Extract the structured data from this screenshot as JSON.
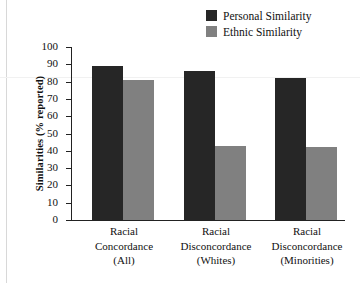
{
  "chart_data": {
    "type": "bar",
    "title": "",
    "xlabel": "",
    "ylabel": "Similarities (% reported)",
    "ylim": [
      0,
      100
    ],
    "ytick_step": 10,
    "grid": false,
    "legend_position": "top-right",
    "categories": [
      "Racial Concordance (All)",
      "Racial Disconcordance (Whites)",
      "Racial Disconcordance (Minorities)"
    ],
    "category_lines": [
      [
        "Racial",
        "Concordance",
        "(All)"
      ],
      [
        "Racial",
        "Disconcordance",
        "(Whites)"
      ],
      [
        "Racial",
        "Disconcordance",
        "(Minorities)"
      ]
    ],
    "yticks": [
      "0",
      "10",
      "20",
      "30",
      "40",
      "50",
      "60",
      "70",
      "80",
      "90",
      "100"
    ],
    "series": [
      {
        "name": "Personal Similarity",
        "color": "#262626",
        "values": [
          89,
          86,
          82
        ]
      },
      {
        "name": "Ethnic Similarity",
        "color": "#808080",
        "values": [
          81,
          43,
          42
        ]
      }
    ]
  },
  "legend": {
    "items": [
      {
        "label": "Personal Similarity",
        "color": "#262626"
      },
      {
        "label": "Ethnic Similarity",
        "color": "#808080"
      }
    ]
  },
  "axis": {
    "y_title": "Similarities (% reported)"
  }
}
